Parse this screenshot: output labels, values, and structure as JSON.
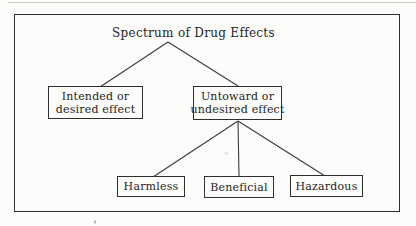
{
  "diagram": {
    "title": "Spectrum of Drug Effects",
    "level1": [
      {
        "id": "intended-effect",
        "lines": [
          "Intended or",
          "desired effect"
        ]
      },
      {
        "id": "untoward-effect",
        "lines": [
          "Untoward or",
          "undesired effect"
        ]
      }
    ],
    "level2": [
      {
        "id": "harmless",
        "label": "Harmless"
      },
      {
        "id": "beneficial",
        "label": "Beneficial"
      },
      {
        "id": "hazardous",
        "label": "Hazardous"
      }
    ],
    "tree": {
      "root": "Spectrum of Drug Effects",
      "children": [
        {
          "label": "Intended or desired effect",
          "children": []
        },
        {
          "label": "Untoward or undesired effect",
          "children": [
            "Harmless",
            "Beneficial",
            "Hazardous"
          ]
        }
      ]
    },
    "colors": {
      "background": "#fcfcfb",
      "line": "#3b3b3b",
      "border": "#2f2f2f",
      "text": "#1f1f1f"
    }
  }
}
